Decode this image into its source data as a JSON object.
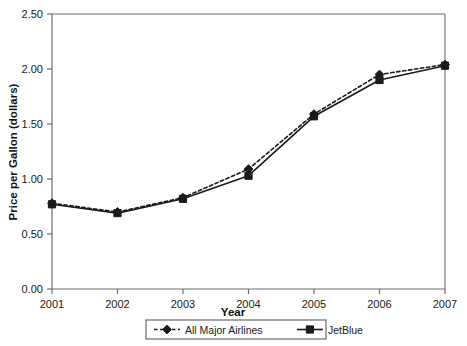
{
  "chart_data": {
    "type": "line",
    "title": "",
    "xlabel": "Year",
    "ylabel": "Price per Gallon (dollars)",
    "x": [
      "2001",
      "2002",
      "2003",
      "2004",
      "2005",
      "2006",
      "2007"
    ],
    "xlim": [
      2001,
      2007
    ],
    "ylim": [
      0.0,
      2.5
    ],
    "yticks": [
      "0.00",
      "0.50",
      "1.00",
      "1.50",
      "2.00",
      "2.50"
    ],
    "ytick_values": [
      0.0,
      0.5,
      1.0,
      1.5,
      2.0,
      2.5
    ],
    "grid": false,
    "legend_position": "bottom",
    "series": [
      {
        "name": "All Major Airlines",
        "marker": "diamond",
        "line_style": "dashed",
        "color": "#1a1a1a",
        "values": [
          0.78,
          0.7,
          0.83,
          1.09,
          1.59,
          1.95,
          2.04
        ]
      },
      {
        "name": "JetBlue",
        "marker": "square",
        "line_style": "solid",
        "color": "#1a1a1a",
        "values": [
          0.77,
          0.69,
          0.82,
          1.03,
          1.57,
          1.9,
          2.03
        ]
      }
    ]
  },
  "colors": {
    "axis": "#6e6e6e",
    "series": "#1a1a1a",
    "background": "#ffffff",
    "legend_border": "#4d4d4d"
  }
}
